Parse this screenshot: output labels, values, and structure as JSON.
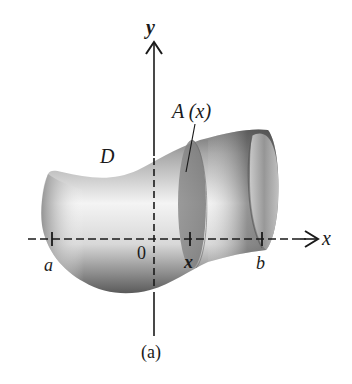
{
  "figure": {
    "caption": "(a)",
    "region_label": "D",
    "cross_section_label": "A (x)",
    "axes": {
      "x_label": "x",
      "y_label": "y",
      "origin_label": "0"
    },
    "ticks": [
      {
        "label": "a"
      },
      {
        "label": "x"
      },
      {
        "label": "b"
      }
    ],
    "colors": {
      "axis": "#1a1a1a",
      "solid_light": "#f2f2f2",
      "solid_mid": "#9a9a9a",
      "solid_dark": "#555555",
      "cross_section": "#7a7a7a"
    }
  }
}
